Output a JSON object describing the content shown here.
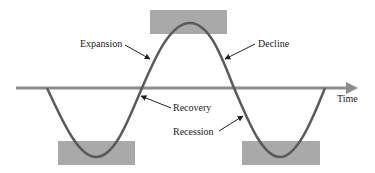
{
  "diagram": {
    "labels": {
      "expansion": "Expansion",
      "decline": "Decline",
      "recovery": "Recovery",
      "recession": "Recession",
      "axis": "Time"
    },
    "colors": {
      "background": "#ffffff",
      "curve": "#5a5a5a",
      "axis": "#8c8c8c",
      "highlight_box": "#a9a9a9",
      "text": "#222222",
      "arrow": "#222222"
    },
    "regions": [
      {
        "name": "peak",
        "position": "top"
      },
      {
        "name": "trough-1",
        "position": "bottom-left"
      },
      {
        "name": "trough-2",
        "position": "bottom-right"
      }
    ]
  }
}
